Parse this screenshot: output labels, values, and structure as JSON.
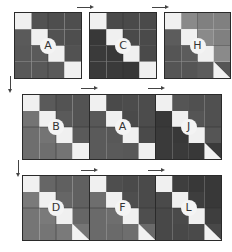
{
  "colors": {
    "diag": "#f0f0f0",
    "triangle": "#f2f2f2",
    "grid": "#2e2e2e"
  },
  "panels": [
    {
      "id": "A",
      "label": "A",
      "row": 0,
      "upper": "#525252",
      "lower": "#5a5a5a",
      "upperCorner": "#4e4e4e",
      "lowerCorner": "#585858",
      "triangle": false
    },
    {
      "id": "C",
      "label": "C",
      "row": 0,
      "upper": "#4a4a4a",
      "lower": "#383838",
      "upperCorner": "#4a4a4a",
      "lowerCorner": "#3a3a3a",
      "triangle": false
    },
    {
      "id": "H",
      "label": "H",
      "row": 0,
      "upper": "#8a8a8a",
      "lower": "#5c5c5c",
      "upperCorner": "#808080",
      "lowerCorner": "#555555",
      "triangle": true
    },
    {
      "id": "B",
      "label": "B",
      "row": 1,
      "upper": "#5a5a5a",
      "lower": "#747474",
      "upperCorner": "#535353",
      "lowerCorner": "#6e6e6e",
      "triangle": false
    },
    {
      "id": "A2",
      "label": "A",
      "row": 1,
      "upper": "#4a4a4a",
      "lower": "#585858",
      "upperCorner": "#4c4c4c",
      "lowerCorner": "#5a5a5a",
      "triangle": false
    },
    {
      "id": "J",
      "label": "J",
      "row": 1,
      "upper": "#555555",
      "lower": "#383838",
      "upperCorner": "#505050",
      "lowerCorner": "#3a3a3a",
      "triangle": true
    },
    {
      "id": "D",
      "label": "D",
      "row": 2,
      "upper": "#666666",
      "lower": "#7a7a7a",
      "upperCorner": "#606060",
      "lowerCorner": "#757575",
      "triangle": true
    },
    {
      "id": "F",
      "label": "F",
      "row": 2,
      "upper": "#4e4e4e",
      "lower": "#6e6e6e",
      "upperCorner": "#4a4a4a",
      "lowerCorner": "#6a6a6a",
      "triangle": true
    },
    {
      "id": "L",
      "label": "L",
      "row": 2,
      "upper": "#3e3e3e",
      "lower": "#4a4a4a",
      "upperCorner": "#383838",
      "lowerCorner": "#484848",
      "triangle": true
    }
  ],
  "arrows": {
    "horizontal_count": 6,
    "vertical_count": 2
  }
}
